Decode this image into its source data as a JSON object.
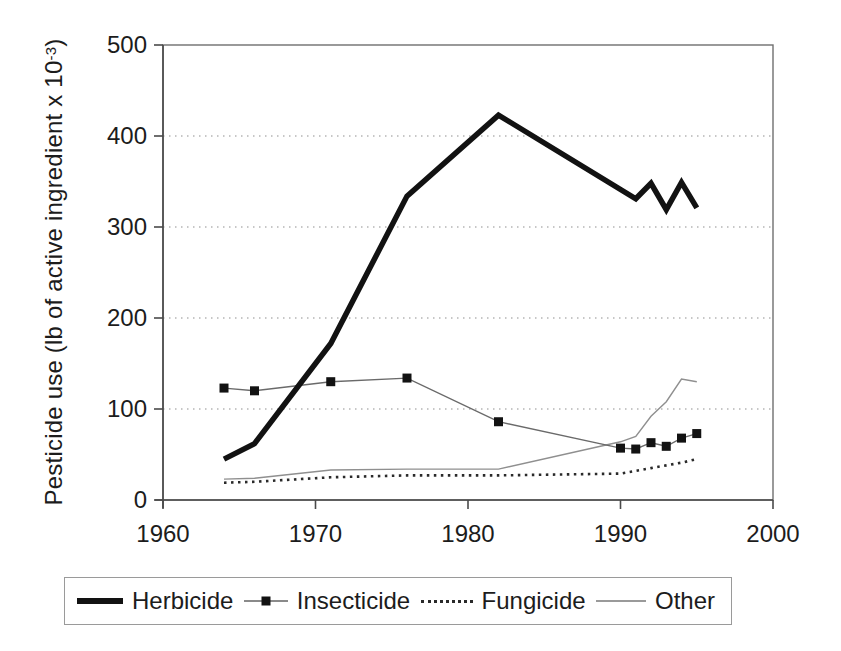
{
  "chart_data": {
    "type": "line",
    "title": "",
    "xlabel": "",
    "ylabel_main": "Pesticide use (lb of active ingredient x 10",
    "ylabel_sup": "-3",
    "ylabel_end": ")",
    "xlim": [
      1960,
      2000
    ],
    "ylim": [
      0,
      500
    ],
    "xticks": [
      1960,
      1970,
      1980,
      1990,
      2000
    ],
    "yticks": [
      0,
      100,
      200,
      300,
      400,
      500
    ],
    "grid": "horizontal-dotted",
    "legend_position": "bottom-outside",
    "colors": {
      "herbicide": "#121212",
      "insecticide_line": "#6a6a6a",
      "insecticide_marker": "#121212",
      "fungicide": "#2a2a2a",
      "other": "#8f8f8f",
      "gridline": "#b5b5b5",
      "frame": "#6f6f6f"
    },
    "series": [
      {
        "name": "Herbicide",
        "style": "thick-solid",
        "color": "#121212",
        "width": 5.5,
        "x": [
          1964,
          1966,
          1971,
          1976,
          1982,
          1991,
          1992,
          1993,
          1994,
          1995
        ],
        "y": [
          45,
          62,
          172,
          334,
          423,
          331,
          348,
          319,
          349,
          321
        ]
      },
      {
        "name": "Insecticide",
        "style": "thin-solid-square-markers",
        "color": "#6a6a6a",
        "width": 1.4,
        "marker": "square",
        "marker_size": 9,
        "marker_color": "#121212",
        "x": [
          1964,
          1966,
          1971,
          1976,
          1982,
          1990,
          1991,
          1992,
          1993,
          1994,
          1995
        ],
        "y": [
          123,
          120,
          130,
          134,
          86,
          57,
          56,
          63,
          59,
          68,
          73
        ]
      },
      {
        "name": "Fungicide",
        "style": "dotted",
        "color": "#2a2a2a",
        "width": 2.6,
        "x": [
          1964,
          1966,
          1971,
          1976,
          1982,
          1990,
          1991,
          1992,
          1993,
          1994,
          1995
        ],
        "y": [
          19,
          20,
          25,
          27,
          27,
          29,
          32,
          35,
          38,
          41,
          45
        ]
      },
      {
        "name": "Other",
        "style": "thin-solid",
        "color": "#8f8f8f",
        "width": 1.4,
        "x": [
          1964,
          1966,
          1971,
          1976,
          1982,
          1990,
          1991,
          1992,
          1993,
          1994,
          1995
        ],
        "y": [
          23,
          24,
          33,
          34,
          34,
          64,
          70,
          92,
          108,
          133,
          130
        ]
      }
    ]
  }
}
